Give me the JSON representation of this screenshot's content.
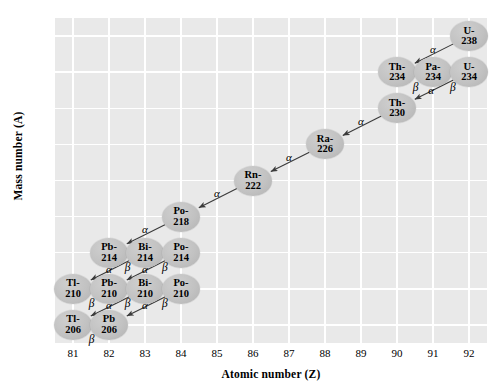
{
  "axes": {
    "x_title": "Atomic number (Z)",
    "y_title": "Mass number (A)",
    "x_ticks": [
      81,
      82,
      83,
      84,
      85,
      86,
      87,
      88,
      89,
      90,
      91,
      92
    ],
    "y_ticks": [
      206,
      210,
      214,
      218,
      222,
      226,
      230,
      234,
      238
    ]
  },
  "colors": {
    "plot_background": "#e9e9e9",
    "gridline": "#ffffff",
    "node_fill": "#c2c2c2",
    "arrow": "#3a3a3a",
    "text": "#000000"
  },
  "chart_data": {
    "type": "scatter",
    "title": "",
    "xlabel": "Atomic number (Z)",
    "ylabel": "Mass number (A)",
    "xlim": [
      80.5,
      92.5
    ],
    "ylim": [
      204,
      240
    ],
    "grid": true,
    "legend": null,
    "nodes": [
      {
        "label_top": "U-",
        "label_bottom": "238",
        "nuclide": "U-238",
        "z": 92,
        "a": 238
      },
      {
        "label_top": "Th-",
        "label_bottom": "234",
        "nuclide": "Th-234",
        "z": 90,
        "a": 234
      },
      {
        "label_top": "Pa-",
        "label_bottom": "234",
        "nuclide": "Pa-234",
        "z": 91,
        "a": 234
      },
      {
        "label_top": "U-",
        "label_bottom": "234",
        "nuclide": "U-234",
        "z": 92,
        "a": 234
      },
      {
        "label_top": "Th-",
        "label_bottom": "230",
        "nuclide": "Th-230",
        "z": 90,
        "a": 230
      },
      {
        "label_top": "Ra-",
        "label_bottom": "226",
        "nuclide": "Ra-226",
        "z": 88,
        "a": 226
      },
      {
        "label_top": "Rn-",
        "label_bottom": "222",
        "nuclide": "Rn-222",
        "z": 86,
        "a": 222
      },
      {
        "label_top": "Po-",
        "label_bottom": "218",
        "nuclide": "Po-218",
        "z": 84,
        "a": 218
      },
      {
        "label_top": "Pb-",
        "label_bottom": "214",
        "nuclide": "Pb-214",
        "z": 82,
        "a": 214
      },
      {
        "label_top": "Bi-",
        "label_bottom": "214",
        "nuclide": "Bi-214",
        "z": 83,
        "a": 214
      },
      {
        "label_top": "Po-",
        "label_bottom": "214",
        "nuclide": "Po-214",
        "z": 84,
        "a": 214
      },
      {
        "label_top": "Tl-",
        "label_bottom": "210",
        "nuclide": "Tl-210",
        "z": 81,
        "a": 210
      },
      {
        "label_top": "Pb-",
        "label_bottom": "210",
        "nuclide": "Pb-210",
        "z": 82,
        "a": 210
      },
      {
        "label_top": "Bi-",
        "label_bottom": "210",
        "nuclide": "Bi-210",
        "z": 83,
        "a": 210
      },
      {
        "label_top": "Po-",
        "label_bottom": "210",
        "nuclide": "Po-210",
        "z": 84,
        "a": 210
      },
      {
        "label_top": "Tl-",
        "label_bottom": "206",
        "nuclide": "Tl-206",
        "z": 81,
        "a": 206
      },
      {
        "label_top": "Pb",
        "label_bottom": "206",
        "nuclide": "Pb-206",
        "z": 82,
        "a": 206
      }
    ],
    "decays": [
      {
        "from": "U-238",
        "to": "Th-234",
        "type": "alpha",
        "symbol": "α",
        "lx": 91.0,
        "ly": 236.6
      },
      {
        "from": "Th-234",
        "to": "Pa-234",
        "type": "beta",
        "symbol": "β",
        "lx": 90.52,
        "ly": 232.4
      },
      {
        "from": "Pa-234",
        "to": "U-234",
        "type": "beta",
        "symbol": "β",
        "lx": 91.55,
        "ly": 232.4
      },
      {
        "from": "U-234",
        "to": "Th-230",
        "type": "alpha",
        "symbol": "α",
        "lx": 90.95,
        "ly": 232.0
      },
      {
        "from": "Th-230",
        "to": "Ra-226",
        "type": "alpha",
        "symbol": "α",
        "lx": 89.0,
        "ly": 228.6
      },
      {
        "from": "Ra-226",
        "to": "Rn-222",
        "type": "alpha",
        "symbol": "α",
        "lx": 87.0,
        "ly": 224.6
      },
      {
        "from": "Rn-222",
        "to": "Po-218",
        "type": "alpha",
        "symbol": "α",
        "lx": 85.0,
        "ly": 220.6
      },
      {
        "from": "Po-218",
        "to": "Pb-214",
        "type": "alpha",
        "symbol": "α",
        "lx": 83.0,
        "ly": 216.6
      },
      {
        "from": "Po-214",
        "to": "Bi-214",
        "type": "beta",
        "symbol": "β",
        "lx": 83.55,
        "ly": 212.4
      },
      {
        "from": "Bi-214",
        "to": "Pb-214",
        "type": "beta",
        "symbol": "β",
        "lx": 82.52,
        "ly": 212.4
      },
      {
        "from": "Po-214",
        "to": "Pb-210",
        "type": "alpha",
        "symbol": "α",
        "lx": 83.0,
        "ly": 212.2
      },
      {
        "from": "Bi-214",
        "to": "Tl-210",
        "type": "alpha",
        "symbol": "α",
        "lx": 82.0,
        "ly": 212.2
      },
      {
        "from": "Po-210",
        "to": "Bi-210",
        "type": "beta",
        "symbol": "β",
        "lx": 83.55,
        "ly": 208.4
      },
      {
        "from": "Bi-210",
        "to": "Pb-210",
        "type": "beta",
        "symbol": "β",
        "lx": 82.52,
        "ly": 208.4
      },
      {
        "from": "Pb-210",
        "to": "Tl-210",
        "type": "beta",
        "symbol": "β",
        "lx": 81.52,
        "ly": 208.4
      },
      {
        "from": "Po-210",
        "to": "Pb-206",
        "type": "alpha",
        "symbol": "α",
        "lx": 83.0,
        "ly": 208.2
      },
      {
        "from": "Bi-210",
        "to": "Tl-206",
        "type": "alpha",
        "symbol": "α",
        "lx": 82.0,
        "ly": 208.2
      },
      {
        "from": "Pb-206",
        "to": "Tl-206",
        "type": "beta",
        "symbol": "β",
        "lx": 81.52,
        "ly": 204.4
      }
    ]
  }
}
